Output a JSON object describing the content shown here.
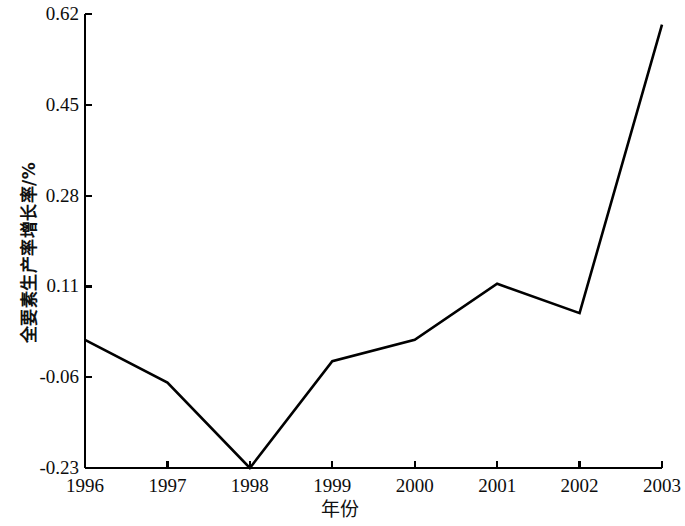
{
  "chart_data": {
    "type": "line",
    "title": "",
    "subtitle": "",
    "xlabel": "年份",
    "ylabel": "全要素生产率增长率/%",
    "categories": [
      "1996",
      "1997",
      "1998",
      "1999",
      "2000",
      "2001",
      "2002",
      "2003"
    ],
    "x": [
      1996,
      1997,
      1998,
      1999,
      2000,
      2001,
      2002,
      2003
    ],
    "values": [
      0.01,
      -0.07,
      -0.23,
      -0.03,
      0.01,
      0.115,
      0.06,
      0.6
    ],
    "series": [
      {
        "name": "全要素生产率增长率",
        "values": [
          0.01,
          -0.07,
          -0.23,
          -0.03,
          0.01,
          0.115,
          0.06,
          0.6
        ]
      }
    ],
    "ylim": [
      -0.23,
      0.62
    ],
    "xlim": [
      1996,
      2003
    ],
    "yticks": [
      -0.23,
      -0.06,
      0.11,
      0.28,
      0.45,
      0.62
    ],
    "ytick_labels": [
      "-0.23",
      "-0.06",
      "0.11",
      "0.28",
      "0.45",
      "0.62"
    ],
    "xticks": [
      1996,
      1997,
      1998,
      1999,
      2000,
      2001,
      2002,
      2003
    ],
    "xtick_labels": [
      "1996",
      "1997",
      "1998",
      "1999",
      "2000",
      "2001",
      "2002",
      "2003"
    ],
    "grid": false,
    "legend": false,
    "legend_position": "none",
    "line_color": "#000000",
    "line_width": 2.6,
    "axis_color": "#000000",
    "background_color": "#ffffff",
    "markers": false,
    "annotations": []
  },
  "axes": {
    "y_tick_labels": [
      {
        "text": "0.62",
        "value": 0.62
      },
      {
        "text": "0.45",
        "value": 0.45
      },
      {
        "text": "0.28",
        "value": 0.28
      },
      {
        "text": "0.11",
        "value": 0.11
      },
      {
        "text": "-0.06",
        "value": -0.06
      },
      {
        "text": "-0.23",
        "value": -0.23
      }
    ],
    "x_tick_labels": [
      {
        "text": "1996",
        "value": 1996
      },
      {
        "text": "1997",
        "value": 1997
      },
      {
        "text": "1998",
        "value": 1998
      },
      {
        "text": "1999",
        "value": 1999
      },
      {
        "text": "2000",
        "value": 2000
      },
      {
        "text": "2001",
        "value": 2001
      },
      {
        "text": "2002",
        "value": 2002
      },
      {
        "text": "2003",
        "value": 2003
      }
    ],
    "y_axis_title": "全要素生产率增长率/%",
    "x_axis_title": "年份"
  }
}
